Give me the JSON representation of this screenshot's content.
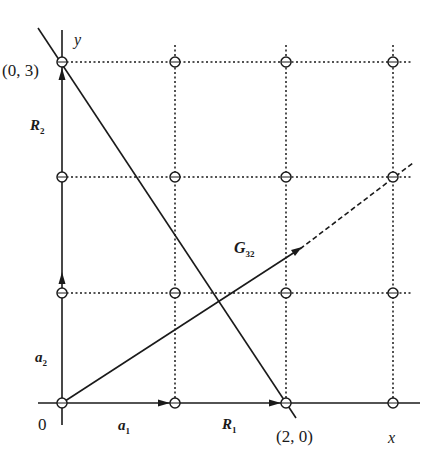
{
  "figure": {
    "colors": {
      "ink": "#1a1a1a",
      "background": "#ffffff"
    }
  },
  "labels": {
    "y_axis": "y",
    "x_axis": "x",
    "origin": "0",
    "point_03": "(0, 3)",
    "point_20": "(2, 0)",
    "a1": {
      "main": "a",
      "sub": "1"
    },
    "a2": {
      "main": "a",
      "sub": "2"
    },
    "R1": {
      "main": "R",
      "sub": "1"
    },
    "R2": {
      "main": "R",
      "sub": "2"
    },
    "G32": {
      "main": "G",
      "sub": "32"
    }
  },
  "lattice": {
    "columns_px": [
      62,
      175,
      286,
      393
    ],
    "rows_px": [
      62,
      177,
      293,
      403
    ],
    "points": "4x4 grid of circled lattice points joined by dotted lines"
  },
  "lines": {
    "plane_line": {
      "from": "(0,3)",
      "to": "(2,0)",
      "description": "solid line through intercepts"
    },
    "reciprocal_vector": {
      "from": "origin",
      "direction": "(3,2)",
      "style": "solid then dashed"
    }
  }
}
